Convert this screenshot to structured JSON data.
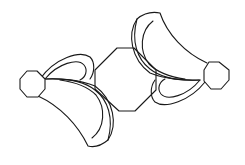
{
  "diagram": {
    "kind": "line-drawing",
    "background": "#ffffff",
    "stroke_color": "#1a1a1a",
    "stroke_width": 1.1,
    "center_octagon": {
      "points": "117,48 134,48 156,70 156,90 135,111 119,111 95,89 95,70"
    },
    "left_octagon": {
      "points": "27,71 37,71 45,79 45,89 38,97 27,97 20,89 20,79"
    },
    "right_octagon": {
      "points": "209,62 219,62 229,70 229,80 221,89 211,89 204,81 204,70"
    },
    "left_upper_outer": "M 40,79 C 55,58 80,50 90,57 C 95,62 95,72 90,79",
    "left_upper_inner": "M 45,79 C 58,63 78,58 84,65 C 88,70 86,77 80,80",
    "left_lower_outer": "M 38,96 C 60,106 78,125 88,146 C 95,148 102,145 108,140 C 118,125 114,100 95,86 C 80,80 60,78 45,79",
    "left_lower_inner": "M 92,138 C 105,128 106,108 96,95 C 88,87 75,82 60,80",
    "left_lower_seam": "M 46,79 C 70,78 85,82 95,90 C 108,100 114,118 108,140",
    "right_lower_outer": "M 205,82 C 190,101 165,109 155,102 C 150,97 150,87 155,80",
    "right_lower_inner": "M 200,80 C 187,96 167,101 161,94 C 157,89 159,82 165,79",
    "right_upper_outer": "M 207,63 C 185,53 167,34 160,13 C 150,11 143,14 137,19 C 127,34 131,59 150,73 C 165,79 185,81 200,80",
    "right_upper_inner": "M 153,21 C 140,31 139,51 149,64 C 157,72 170,77 185,79",
    "right_upper_seam": "M 199,80 C 175,81 160,77 150,69 C 137,59 131,41 137,19"
  }
}
